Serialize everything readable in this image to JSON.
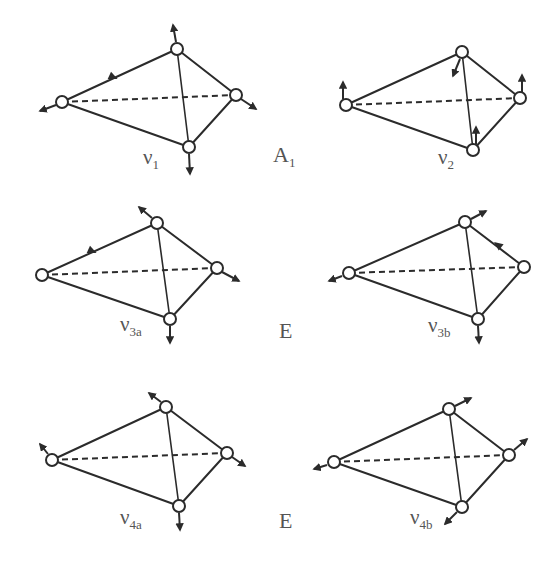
{
  "figure": {
    "colors": {
      "line": "#2b2b2b",
      "label": "#555555",
      "vertex_fill": "#ffffff",
      "background": "#ffffff"
    }
  },
  "symmetry_labels": [
    {
      "id": "A1",
      "main": "A",
      "sub": "1",
      "x": 273,
      "y": 142
    },
    {
      "id": "E-1",
      "main": "E",
      "sub": "",
      "x": 279,
      "y": 318
    },
    {
      "id": "E-2",
      "main": "E",
      "sub": "",
      "x": 279,
      "y": 508
    }
  ],
  "modes": [
    {
      "id": "v1",
      "symbol": "ν",
      "sub": "1",
      "symmetry": "A1",
      "label_pos": [
        143,
        145
      ],
      "vertices": {
        "left": [
          62,
          102
        ],
        "top": [
          177,
          49
        ],
        "right": [
          236,
          95
        ],
        "bottom": [
          189,
          147
        ]
      },
      "displacements": [
        {
          "from": [
            56,
            105
          ],
          "to": [
            40,
            111
          ]
        },
        {
          "from": [
            176,
            42
          ],
          "to": [
            173,
            25
          ]
        },
        {
          "from": [
            241,
            99
          ],
          "to": [
            256,
            109
          ]
        },
        {
          "from": [
            189,
            154
          ],
          "to": [
            190,
            174
          ]
        }
      ],
      "edge_arrows": [
        {
          "at": [
            113,
            77
          ],
          "dir": [
            115,
            53
          ]
        }
      ]
    },
    {
      "id": "v2",
      "symbol": "ν",
      "sub": "2",
      "symmetry": "A1",
      "label_pos": [
        438,
        145
      ],
      "vertices": {
        "left": [
          346,
          105
        ],
        "top": [
          462,
          52
        ],
        "right": [
          520,
          98
        ],
        "bottom": [
          473,
          150
        ]
      },
      "displacements": [
        {
          "from": [
            343,
            99
          ],
          "to": [
            343,
            82
          ]
        },
        {
          "from": [
            460,
            59
          ],
          "to": [
            453,
            76
          ]
        },
        {
          "from": [
            522,
            92
          ],
          "to": [
            522,
            75
          ]
        },
        {
          "from": [
            476,
            144
          ],
          "to": [
            476,
            127
          ]
        }
      ],
      "edge_arrows": []
    },
    {
      "id": "v3a",
      "symbol": "ν",
      "sub": "3a",
      "symmetry": "E",
      "label_pos": [
        120,
        312
      ],
      "vertices": {
        "left": [
          42,
          275
        ],
        "top": [
          157,
          223
        ],
        "right": [
          217,
          268
        ],
        "bottom": [
          170,
          319
        ]
      },
      "displacements": [
        {
          "from": [
            152,
            218
          ],
          "to": [
            139,
            207
          ]
        },
        {
          "from": [
            222,
            272
          ],
          "to": [
            239,
            281
          ]
        },
        {
          "from": [
            170,
            326
          ],
          "to": [
            170,
            343
          ]
        }
      ],
      "edge_arrows": [
        {
          "at": [
            92,
            251
          ],
          "dir": [
            115,
            52
          ]
        }
      ]
    },
    {
      "id": "v3b",
      "symbol": "ν",
      "sub": "3b",
      "symmetry": "E",
      "label_pos": [
        428,
        313
      ],
      "vertices": {
        "left": [
          349,
          273
        ],
        "top": [
          465,
          222
        ],
        "right": [
          524,
          267
        ],
        "bottom": [
          478,
          319
        ]
      },
      "displacements": [
        {
          "from": [
            342,
            276
          ],
          "to": [
            329,
            281
          ]
        },
        {
          "from": [
            471,
            219
          ],
          "to": [
            486,
            211
          ]
        },
        {
          "from": [
            478,
            326
          ],
          "to": [
            479,
            343
          ]
        }
      ],
      "edge_arrows": [
        {
          "at": [
            498,
            245
          ],
          "dir": [
            -59,
            -45
          ]
        }
      ]
    },
    {
      "id": "v4a",
      "symbol": "ν",
      "sub": "4a",
      "symmetry": "E",
      "label_pos": [
        120,
        505
      ],
      "vertices": {
        "left": [
          52,
          460
        ],
        "top": [
          166,
          407
        ],
        "right": [
          227,
          453
        ],
        "bottom": [
          179,
          506
        ]
      },
      "displacements": [
        {
          "from": [
            48,
            454
          ],
          "to": [
            40,
            444
          ]
        },
        {
          "from": [
            161,
            402
          ],
          "to": [
            149,
            393
          ]
        },
        {
          "from": [
            232,
            457
          ],
          "to": [
            245,
            466
          ]
        },
        {
          "from": [
            179,
            513
          ],
          "to": [
            180,
            530
          ]
        }
      ],
      "edge_arrows": []
    },
    {
      "id": "v4b",
      "symbol": "ν",
      "sub": "4b",
      "symmetry": "E",
      "label_pos": [
        410,
        505
      ],
      "vertices": {
        "left": [
          334,
          462
        ],
        "top": [
          449,
          409
        ],
        "right": [
          509,
          455
        ],
        "bottom": [
          462,
          507
        ]
      },
      "displacements": [
        {
          "from": [
            327,
            465
          ],
          "to": [
            314,
            469
          ]
        },
        {
          "from": [
            455,
            406
          ],
          "to": [
            471,
            398
          ]
        },
        {
          "from": [
            514,
            450
          ],
          "to": [
            527,
            439
          ]
        },
        {
          "from": [
            457,
            512
          ],
          "to": [
            445,
            524
          ]
        }
      ],
      "edge_arrows": []
    }
  ]
}
